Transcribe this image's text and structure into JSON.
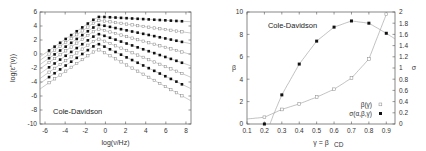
{
  "chart_data": [
    {
      "type": "line",
      "title": "",
      "annotation": "Cole-Davidson",
      "xlabel": "log(ν/Hz)",
      "ylabel": "log(ε''(ν))",
      "xlim": [
        -6.5,
        8.5
      ],
      "ylim": [
        -10,
        6
      ],
      "xticks": [
        -6,
        -4,
        -2,
        0,
        2,
        4,
        6,
        8
      ],
      "yticks": [
        -10,
        -8,
        -6,
        -4,
        -2,
        0,
        2,
        4,
        6
      ],
      "grid": false,
      "legend": null,
      "description": "Family of 8 alternating open/filled square series with fitted lines; slope ~1 on low-frequency side, peak near log(nu)=-1..0, decreasing high-frequency wing with steeper slopes for lower curves",
      "series": [
        {
          "name": "curve1",
          "marker": "filled",
          "peak_x": -0.8,
          "peak_y": 5.3,
          "low_slope": 1.0,
          "high_slope": -0.08
        },
        {
          "name": "curve2",
          "marker": "open",
          "peak_x": -0.8,
          "peak_y": 4.8,
          "low_slope": 1.0,
          "high_slope": -0.2
        },
        {
          "name": "curve3",
          "marker": "filled",
          "peak_x": -0.8,
          "peak_y": 4.2,
          "low_slope": 1.0,
          "high_slope": -0.3
        },
        {
          "name": "curve4",
          "marker": "open",
          "peak_x": -0.8,
          "peak_y": 3.6,
          "low_slope": 1.0,
          "high_slope": -0.4
        },
        {
          "name": "curve5",
          "marker": "filled",
          "peak_x": -0.8,
          "peak_y": 2.9,
          "low_slope": 1.0,
          "high_slope": -0.5
        },
        {
          "name": "curve6",
          "marker": "open",
          "peak_x": -0.8,
          "peak_y": 2.2,
          "low_slope": 1.0,
          "high_slope": -0.6
        },
        {
          "name": "curve7",
          "marker": "filled",
          "peak_x": -0.8,
          "peak_y": 1.5,
          "low_slope": 1.0,
          "high_slope": -0.7
        },
        {
          "name": "curve8",
          "marker": "open",
          "peak_x": -0.8,
          "peak_y": 0.7,
          "low_slope": 1.0,
          "high_slope": -0.8
        }
      ]
    },
    {
      "type": "scatter",
      "title": "",
      "annotation": "Cole-Davidson",
      "xlabel": "γ = β_CD",
      "ylabel": "β",
      "y2label": "σ",
      "xlim": [
        0.1,
        0.95
      ],
      "ylim": [
        0,
        10
      ],
      "y2lim": [
        0,
        2
      ],
      "xticks": [
        0.1,
        0.2,
        0.3,
        0.4,
        0.5,
        0.6,
        0.7,
        0.8,
        0.9
      ],
      "yticks": [
        0,
        2,
        4,
        6,
        8,
        10
      ],
      "y2ticks": [
        0,
        0.2,
        0.4,
        0.6,
        0.8,
        1,
        1.2,
        1.4,
        1.6,
        1.8,
        2
      ],
      "grid": false,
      "legend": {
        "position": "lower right",
        "entries": [
          "β(γ)",
          "σ(α,β,γ)"
        ]
      },
      "series": [
        {
          "name": "β(γ)",
          "marker": "open",
          "axis": "left",
          "x": [
            0.2,
            0.3,
            0.4,
            0.5,
            0.6,
            0.7,
            0.8,
            0.9
          ],
          "y": [
            0.6,
            1.3,
            1.8,
            2.4,
            3.1,
            4.1,
            5.8,
            9.8
          ]
        },
        {
          "name": "σ(α,β,γ)",
          "marker": "filled",
          "axis": "right",
          "x": [
            0.2,
            0.3,
            0.4,
            0.5,
            0.6,
            0.7,
            0.8,
            0.9
          ],
          "y": [
            0.0,
            0.52,
            1.07,
            1.48,
            1.73,
            1.84,
            1.8,
            1.62
          ]
        }
      ]
    }
  ]
}
